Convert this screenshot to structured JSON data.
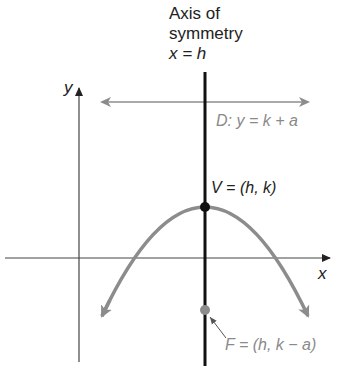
{
  "diagram": {
    "title_lines": [
      "Axis of",
      "symmetry",
      "x = h"
    ],
    "axes": {
      "x_label": "x",
      "y_label": "y"
    },
    "directrix_label": "D: y = k + a",
    "vertex_label": "V = (h, k)",
    "focus_label": "F = (h, k − a)",
    "colors": {
      "axis_of_symmetry": "#111111",
      "axes": "#555555",
      "parabola": "#8c8c8c",
      "directrix": "#8c8c8c",
      "vertex_point": "#111111",
      "focus_point": "#8c8c8c",
      "gray_text": "#8a8a8a"
    }
  }
}
